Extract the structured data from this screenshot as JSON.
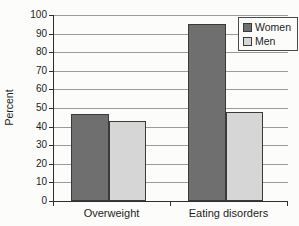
{
  "chart_data": {
    "type": "bar",
    "title": "",
    "categories": [
      "Overweight",
      "Eating disorders"
    ],
    "series": [
      {
        "name": "Women",
        "values": [
          47,
          95
        ],
        "color": "#6f6f6f"
      },
      {
        "name": "Men",
        "values": [
          43,
          48
        ],
        "color": "#d6d6d6"
      }
    ],
    "ylabel": "Percent",
    "xlabel": "",
    "ylim": [
      0,
      100
    ],
    "yticks": [
      0,
      10,
      20,
      30,
      40,
      50,
      60,
      70,
      80,
      90,
      100
    ],
    "grid": true,
    "legend_position": "top-right"
  },
  "colors": {
    "bar_border": "#3a3a3a",
    "gridline": "#9a9a9a",
    "axis": "#2e2e2e",
    "text": "#1d1d1d",
    "background": "#fcfcfa"
  }
}
